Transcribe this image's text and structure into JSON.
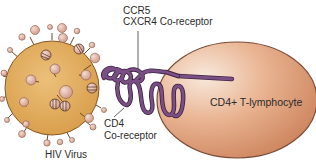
{
  "diagram": {
    "labels": {
      "coreceptor_line1": "CCR5",
      "coreceptor_line2": "CXCR4 Co-receptor",
      "cd4_line1": "CD4",
      "cd4_line2": "Co-receptor",
      "virus": "HIV Virus",
      "cell": "CD4+ T-lymphocyte"
    },
    "colors": {
      "virus_fill": "#e2a955",
      "virus_edge": "#8a5a24",
      "spike_knob": "#e5b5a5",
      "cell_fill": "#dd9c78",
      "cell_highlight": "#f6e4d3",
      "cell_edge": "#7a4a34",
      "protein": "#7b4f86",
      "protein_edge": "#3e2443",
      "label_text": "#2a2a2a",
      "leader_line": "#3a3a3a"
    }
  }
}
